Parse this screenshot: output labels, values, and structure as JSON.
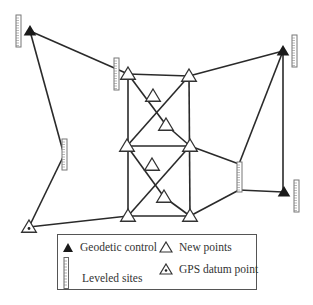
{
  "diagram": {
    "title": "",
    "colors": {
      "line": "#2a2a2a",
      "fill_control": "#1a1a1a",
      "new_point_fill": "#ffffff",
      "staff": "#777777"
    },
    "nodes": {
      "geodetic_control": [
        {
          "id": "G1",
          "x": 30,
          "y": 31
        },
        {
          "id": "G2",
          "x": 283,
          "y": 51
        },
        {
          "id": "G3",
          "x": 284,
          "y": 192
        }
      ],
      "new_points": [
        {
          "id": "A1",
          "x": 128,
          "y": 74
        },
        {
          "id": "A2",
          "x": 189,
          "y": 76
        },
        {
          "id": "B1",
          "x": 153,
          "y": 96
        },
        {
          "id": "B2",
          "x": 166,
          "y": 125
        },
        {
          "id": "C1",
          "x": 127,
          "y": 146
        },
        {
          "id": "C2",
          "x": 190,
          "y": 146
        },
        {
          "id": "D1",
          "x": 152,
          "y": 165
        },
        {
          "id": "D2",
          "x": 164,
          "y": 197
        },
        {
          "id": "E1",
          "x": 128,
          "y": 216
        },
        {
          "id": "E2",
          "x": 190,
          "y": 216
        }
      ],
      "gps_datum": [
        {
          "id": "P",
          "x": 29,
          "y": 227
        }
      ],
      "leveled_sites": [
        {
          "id": "L1",
          "x": 16,
          "y": 15,
          "h": 32
        },
        {
          "id": "L2",
          "x": 114,
          "y": 58,
          "h": 32
        },
        {
          "id": "L3",
          "x": 292,
          "y": 35,
          "h": 32
        },
        {
          "id": "L4",
          "x": 62,
          "y": 139,
          "h": 31
        },
        {
          "id": "L5",
          "x": 237,
          "y": 162,
          "h": 30
        },
        {
          "id": "L6",
          "x": 294,
          "y": 180,
          "h": 32
        }
      ]
    },
    "edges": [
      [
        30,
        31,
        128,
        74
      ],
      [
        30,
        31,
        64,
        155
      ],
      [
        64,
        155,
        29,
        227
      ],
      [
        29,
        227,
        128,
        216
      ],
      [
        128,
        74,
        189,
        76
      ],
      [
        189,
        76,
        283,
        51
      ],
      [
        283,
        51,
        283,
        192
      ],
      [
        283,
        51,
        239,
        164
      ],
      [
        239,
        190,
        283,
        192
      ],
      [
        239,
        164,
        239,
        190
      ],
      [
        190,
        146,
        239,
        164
      ],
      [
        190,
        216,
        239,
        190
      ],
      [
        128,
        74,
        128,
        216
      ],
      [
        189,
        76,
        190,
        216
      ],
      [
        127,
        146,
        190,
        146
      ],
      [
        128,
        216,
        190,
        216
      ],
      [
        128,
        74,
        166,
        125
      ],
      [
        166,
        125,
        190,
        146
      ],
      [
        189,
        76,
        127,
        146
      ],
      [
        127,
        146,
        164,
        197
      ],
      [
        164,
        197,
        190,
        216
      ],
      [
        190,
        146,
        128,
        216
      ]
    ]
  },
  "legend": {
    "geodetic_control_label": "Geodetic control",
    "new_points_label": "New points",
    "leveled_sites_label": "Leveled sites",
    "gps_datum_label": "GPS datum point"
  }
}
